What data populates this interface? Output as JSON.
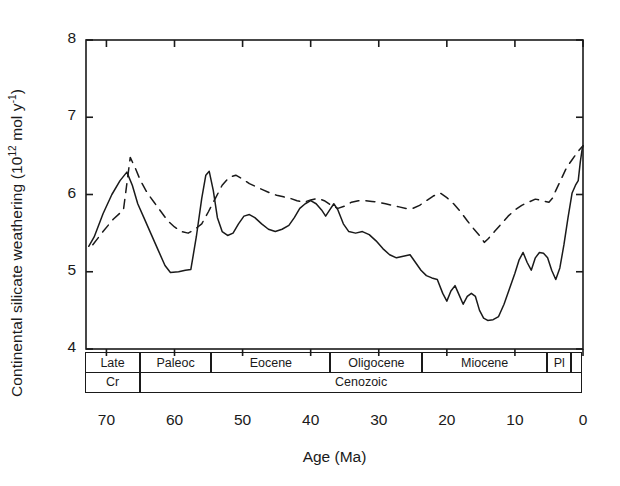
{
  "axes": {
    "ylabel_prefix": "Continental silicate weathering (10",
    "ylabel_sup": "12",
    "ylabel_mid": " mol y",
    "ylabel_sup2": "-1",
    "ylabel_suffix": ")",
    "ylabel_full": "Continental silicate weathering (10^12 mol y^-1)",
    "xlabel": "Age (Ma)",
    "yticks": [
      "8",
      "7",
      "6",
      "5",
      "4"
    ],
    "ytick_values": [
      8,
      7,
      6,
      5,
      4
    ],
    "xticks": [
      "70",
      "60",
      "50",
      "40",
      "30",
      "20",
      "10",
      "0"
    ],
    "xtick_values": [
      70,
      60,
      50,
      40,
      30,
      20,
      10,
      0
    ]
  },
  "timescale": {
    "epochs": [
      {
        "label": "Late",
        "start": 73.0,
        "end": 65.0
      },
      {
        "label": "Paleoc",
        "start": 65.0,
        "end": 54.5
      },
      {
        "label": "Eocene",
        "start": 54.5,
        "end": 37.0
      },
      {
        "label": "Oligocene",
        "start": 37.0,
        "end": 23.5
      },
      {
        "label": "Miocene",
        "start": 23.5,
        "end": 5.2
      },
      {
        "label": "Pl",
        "start": 5.2,
        "end": 1.6
      },
      {
        "label": "",
        "start": 1.6,
        "end": 0.0
      }
    ],
    "eras": [
      {
        "label": "Cr",
        "start": 73.0,
        "end": 65.0
      },
      {
        "label": "Cenozoic",
        "start": 65.0,
        "end": 0.0
      }
    ]
  },
  "chart_data": {
    "type": "line",
    "title": "",
    "xlabel": "Age (Ma)",
    "ylabel": "Continental silicate weathering (10^12 mol y^-1)",
    "xlim": [
      73,
      0
    ],
    "ylim": [
      4,
      8
    ],
    "x_inverted": true,
    "grid": false,
    "legend": "none",
    "series": [
      {
        "name": "solid-curve",
        "style": "solid",
        "color": "#1a1a1a",
        "points": [
          [
            72.6,
            5.33
          ],
          [
            71.8,
            5.45
          ],
          [
            70.5,
            5.75
          ],
          [
            69.2,
            6.0
          ],
          [
            68.0,
            6.18
          ],
          [
            67.0,
            6.29
          ],
          [
            66.2,
            6.12
          ],
          [
            65.4,
            5.88
          ],
          [
            64.5,
            5.7
          ],
          [
            63.5,
            5.5
          ],
          [
            62.4,
            5.28
          ],
          [
            61.4,
            5.08
          ],
          [
            60.6,
            4.99
          ],
          [
            59.4,
            5.0
          ],
          [
            58.4,
            5.02
          ],
          [
            57.6,
            5.03
          ],
          [
            56.8,
            5.45
          ],
          [
            56.0,
            5.95
          ],
          [
            55.4,
            6.25
          ],
          [
            54.9,
            6.3
          ],
          [
            54.3,
            6.05
          ],
          [
            53.7,
            5.7
          ],
          [
            53.0,
            5.52
          ],
          [
            52.2,
            5.47
          ],
          [
            51.4,
            5.5
          ],
          [
            50.6,
            5.62
          ],
          [
            49.8,
            5.72
          ],
          [
            49.0,
            5.74
          ],
          [
            48.2,
            5.7
          ],
          [
            47.2,
            5.62
          ],
          [
            46.2,
            5.55
          ],
          [
            45.2,
            5.52
          ],
          [
            44.2,
            5.55
          ],
          [
            43.2,
            5.6
          ],
          [
            42.4,
            5.7
          ],
          [
            41.6,
            5.82
          ],
          [
            40.8,
            5.88
          ],
          [
            40.0,
            5.92
          ],
          [
            39.2,
            5.88
          ],
          [
            38.4,
            5.8
          ],
          [
            37.8,
            5.72
          ],
          [
            37.2,
            5.8
          ],
          [
            36.6,
            5.88
          ],
          [
            36.0,
            5.8
          ],
          [
            35.2,
            5.62
          ],
          [
            34.4,
            5.52
          ],
          [
            33.4,
            5.5
          ],
          [
            32.4,
            5.52
          ],
          [
            31.4,
            5.48
          ],
          [
            30.4,
            5.4
          ],
          [
            29.4,
            5.3
          ],
          [
            28.4,
            5.22
          ],
          [
            27.4,
            5.18
          ],
          [
            26.4,
            5.2
          ],
          [
            25.4,
            5.22
          ],
          [
            24.6,
            5.12
          ],
          [
            23.8,
            5.02
          ],
          [
            23.0,
            4.95
          ],
          [
            22.2,
            4.92
          ],
          [
            21.4,
            4.9
          ],
          [
            20.6,
            4.72
          ],
          [
            20.0,
            4.62
          ],
          [
            19.4,
            4.75
          ],
          [
            18.8,
            4.82
          ],
          [
            18.2,
            4.7
          ],
          [
            17.6,
            4.58
          ],
          [
            17.0,
            4.68
          ],
          [
            16.4,
            4.72
          ],
          [
            15.8,
            4.68
          ],
          [
            15.2,
            4.5
          ],
          [
            14.6,
            4.4
          ],
          [
            14.0,
            4.37
          ],
          [
            13.2,
            4.38
          ],
          [
            12.4,
            4.42
          ],
          [
            11.6,
            4.58
          ],
          [
            10.8,
            4.78
          ],
          [
            10.0,
            4.98
          ],
          [
            9.4,
            5.15
          ],
          [
            8.8,
            5.25
          ],
          [
            8.2,
            5.12
          ],
          [
            7.6,
            5.02
          ],
          [
            7.0,
            5.18
          ],
          [
            6.4,
            5.25
          ],
          [
            5.8,
            5.24
          ],
          [
            5.2,
            5.18
          ],
          [
            4.6,
            5.02
          ],
          [
            4.0,
            4.9
          ],
          [
            3.4,
            5.05
          ],
          [
            2.8,
            5.35
          ],
          [
            2.2,
            5.7
          ],
          [
            1.6,
            6.02
          ],
          [
            1.1,
            6.12
          ],
          [
            0.7,
            6.18
          ],
          [
            0.4,
            6.42
          ],
          [
            0.1,
            6.6
          ],
          [
            0.0,
            6.63
          ]
        ]
      },
      {
        "name": "dashed-curve",
        "style": "dashed",
        "color": "#1a1a1a",
        "points": [
          [
            72.0,
            5.35
          ],
          [
            70.5,
            5.52
          ],
          [
            69.0,
            5.68
          ],
          [
            67.5,
            5.8
          ],
          [
            66.5,
            6.48
          ],
          [
            65.8,
            6.35
          ],
          [
            65.0,
            6.18
          ],
          [
            64.0,
            6.02
          ],
          [
            63.0,
            5.9
          ],
          [
            62.0,
            5.78
          ],
          [
            61.0,
            5.66
          ],
          [
            60.0,
            5.58
          ],
          [
            59.0,
            5.52
          ],
          [
            58.0,
            5.5
          ],
          [
            57.0,
            5.55
          ],
          [
            56.0,
            5.62
          ],
          [
            55.0,
            5.78
          ],
          [
            54.0,
            5.95
          ],
          [
            53.0,
            6.12
          ],
          [
            52.0,
            6.22
          ],
          [
            51.0,
            6.25
          ],
          [
            50.0,
            6.2
          ],
          [
            49.0,
            6.14
          ],
          [
            48.0,
            6.1
          ],
          [
            47.0,
            6.06
          ],
          [
            46.0,
            6.02
          ],
          [
            45.0,
            5.99
          ],
          [
            44.0,
            5.97
          ],
          [
            43.0,
            5.95
          ],
          [
            42.0,
            5.92
          ],
          [
            41.0,
            5.9
          ],
          [
            40.0,
            5.93
          ],
          [
            39.0,
            5.95
          ],
          [
            38.0,
            5.92
          ],
          [
            37.0,
            5.86
          ],
          [
            36.0,
            5.82
          ],
          [
            35.0,
            5.85
          ],
          [
            34.0,
            5.9
          ],
          [
            33.0,
            5.92
          ],
          [
            32.0,
            5.92
          ],
          [
            31.0,
            5.91
          ],
          [
            30.0,
            5.9
          ],
          [
            29.0,
            5.88
          ],
          [
            28.0,
            5.86
          ],
          [
            27.0,
            5.84
          ],
          [
            26.0,
            5.82
          ],
          [
            25.0,
            5.82
          ],
          [
            24.0,
            5.86
          ],
          [
            23.0,
            5.92
          ],
          [
            22.0,
            5.98
          ],
          [
            21.0,
            6.02
          ],
          [
            20.0,
            5.96
          ],
          [
            19.0,
            5.88
          ],
          [
            18.0,
            5.78
          ],
          [
            17.0,
            5.66
          ],
          [
            16.0,
            5.55
          ],
          [
            15.0,
            5.45
          ],
          [
            14.5,
            5.38
          ],
          [
            14.0,
            5.42
          ],
          [
            13.0,
            5.52
          ],
          [
            12.0,
            5.62
          ],
          [
            11.0,
            5.72
          ],
          [
            10.0,
            5.8
          ],
          [
            9.0,
            5.86
          ],
          [
            8.0,
            5.9
          ],
          [
            7.0,
            5.94
          ],
          [
            6.0,
            5.92
          ],
          [
            5.0,
            5.9
          ],
          [
            4.5,
            5.95
          ],
          [
            4.0,
            6.05
          ],
          [
            3.2,
            6.2
          ],
          [
            2.4,
            6.35
          ],
          [
            1.6,
            6.45
          ],
          [
            0.8,
            6.55
          ],
          [
            0.0,
            6.63
          ]
        ]
      }
    ]
  }
}
